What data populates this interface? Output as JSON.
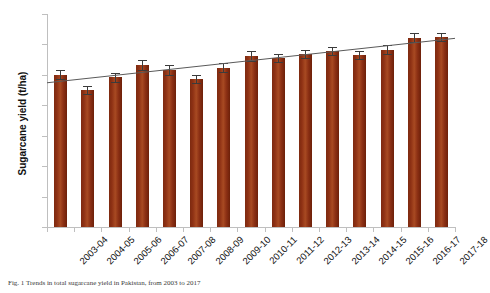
{
  "figure": {
    "caption": "Fig. 1 Trends in total sugarcane yield in Pakistan, from 2003 to 2017"
  },
  "chart_data": {
    "type": "bar",
    "title": "",
    "xlabel": "",
    "ylabel": "Sugarcane yield (t/ha)",
    "ylim": [
      0,
      70
    ],
    "ytick_labels": [
      "0",
      "10",
      "20",
      "30",
      "40",
      "50",
      "60",
      "70"
    ],
    "ytick_values": [
      0,
      10,
      20,
      30,
      40,
      50,
      60,
      70
    ],
    "grid": false,
    "legend": "none",
    "categories": [
      "2003-04",
      "2004-05",
      "2005-06",
      "2006-07",
      "2007-08",
      "2008-09",
      "2009-10",
      "2010-11",
      "2011-12",
      "2012-13",
      "2013-14",
      "2014-15",
      "2015-16",
      "2016-17",
      "2017-18"
    ],
    "values": [
      50.0,
      45.0,
      49.2,
      53.2,
      51.6,
      48.6,
      52.4,
      56.2,
      55.6,
      56.8,
      57.8,
      56.6,
      58.2,
      62.2,
      62.4
    ],
    "errors": [
      1.5,
      1.3,
      1.4,
      1.6,
      1.5,
      1.3,
      1.4,
      1.5,
      1.3,
      1.4,
      1.4,
      1.3,
      1.5,
      1.4,
      1.3
    ],
    "series": [
      {
        "name": "Sugarcane yield",
        "values": [
          50.0,
          45.0,
          49.2,
          53.2,
          51.6,
          48.6,
          52.4,
          56.2,
          55.6,
          56.8,
          57.8,
          56.6,
          58.2,
          62.2,
          62.4
        ],
        "color": "#8e3114"
      }
    ],
    "trendline": {
      "type": "linear",
      "start_value": 47.4,
      "end_value": 62.0,
      "color": "#5a5a5a"
    },
    "bar_color": "#8e3114",
    "error_bar_color": "#3b3b3b"
  }
}
